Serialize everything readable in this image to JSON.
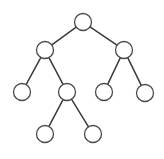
{
  "figure": {
    "width": 164,
    "height": 159,
    "background_color": "#ffffff",
    "node_fill_color": "#ffffff",
    "node_stroke_color": "#4a4a50",
    "edge_color": "#3a3a3f",
    "node_radius": 8.5,
    "edge_width": 1.5,
    "node_stroke_width": 1.3
  },
  "graph": {
    "type": "tree",
    "node_count": 9,
    "edge_count": 8,
    "depth": 4,
    "nodes": [
      {
        "id": "root",
        "label": "",
        "x": 83,
        "y": 22,
        "level": 0,
        "role": "root"
      },
      {
        "id": "left",
        "label": "",
        "x": 45,
        "y": 50,
        "level": 1,
        "role": "internal"
      },
      {
        "id": "right",
        "label": "",
        "x": 124,
        "y": 50,
        "level": 1,
        "role": "internal"
      },
      {
        "id": "left-left",
        "label": "",
        "x": 22,
        "y": 92,
        "level": 2,
        "role": "leaf"
      },
      {
        "id": "left-right",
        "label": "",
        "x": 67,
        "y": 92,
        "level": 2,
        "role": "internal"
      },
      {
        "id": "right-left",
        "label": "",
        "x": 104,
        "y": 92,
        "level": 2,
        "role": "leaf"
      },
      {
        "id": "right-right",
        "label": "",
        "x": 145,
        "y": 93,
        "level": 2,
        "role": "leaf"
      },
      {
        "id": "left-right-left",
        "label": "",
        "x": 45,
        "y": 134,
        "level": 3,
        "role": "leaf"
      },
      {
        "id": "left-right-right",
        "label": "",
        "x": 93,
        "y": 134,
        "level": 3,
        "role": "leaf"
      }
    ],
    "edges": [
      {
        "id": "edge-root-left",
        "from": "root",
        "to": "left"
      },
      {
        "id": "edge-root-right",
        "from": "root",
        "to": "right"
      },
      {
        "id": "edge-left-leftleft",
        "from": "left",
        "to": "left-left"
      },
      {
        "id": "edge-left-leftright",
        "from": "left",
        "to": "left-right"
      },
      {
        "id": "edge-right-rightleft",
        "from": "right",
        "to": "right-left"
      },
      {
        "id": "edge-right-rightright",
        "from": "right",
        "to": "right-right"
      },
      {
        "id": "edge-leftright-child-left",
        "from": "left-right",
        "to": "left-right-left"
      },
      {
        "id": "edge-leftright-child-right",
        "from": "left-right",
        "to": "left-right-right"
      }
    ]
  }
}
